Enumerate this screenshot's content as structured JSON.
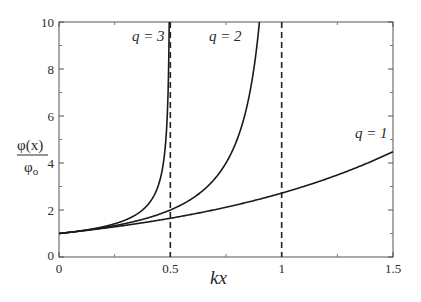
{
  "chart_data": {
    "type": "line",
    "title": "",
    "xlabel": "kx",
    "ylabel": "φ(x) / φ₀",
    "xlim": [
      0,
      1.5
    ],
    "ylim": [
      0,
      10
    ],
    "x_ticks": [
      "0",
      "0.5",
      "1",
      "1.5"
    ],
    "y_ticks": [
      "0",
      "2",
      "4",
      "6",
      "8",
      "10"
    ],
    "grid": false,
    "legend": "inline labels",
    "series": [
      {
        "name": "q = 1",
        "q": 1,
        "x": [
          0,
          0.25,
          0.5,
          0.75,
          1.0,
          1.25,
          1.5
        ],
        "values": [
          1.0,
          1.28,
          1.65,
          2.12,
          2.72,
          3.49,
          4.48
        ]
      },
      {
        "name": "q = 2",
        "q": 2,
        "x": [
          0,
          0.25,
          0.5,
          0.6,
          0.7,
          0.8,
          0.9
        ],
        "values": [
          1.0,
          1.33,
          2.0,
          2.5,
          3.33,
          5.0,
          10.0
        ]
      },
      {
        "name": "q = 3",
        "q": 3,
        "x": [
          0,
          0.2,
          0.3,
          0.4,
          0.45,
          0.48,
          0.495
        ],
        "values": [
          1.0,
          1.29,
          1.58,
          2.24,
          3.16,
          5.0,
          10.0
        ]
      }
    ],
    "annotations": [
      {
        "type": "vline",
        "x": 0.5,
        "style": "dashed"
      },
      {
        "type": "vline",
        "x": 1.0,
        "style": "dashed"
      }
    ]
  },
  "labels": {
    "q1": "q = 1",
    "q2": "q = 2",
    "q3": "q = 3",
    "xlabel": "kx",
    "ylabel_num": "φ(x)",
    "ylabel_den": "φ",
    "ylabel_den_sub": "o"
  }
}
